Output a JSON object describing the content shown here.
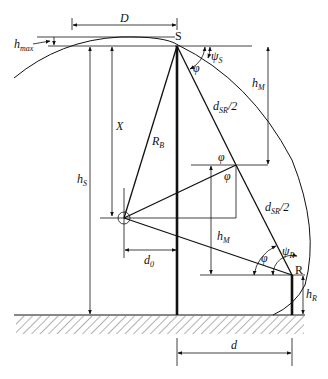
{
  "diagram": {
    "colors": {
      "line": "#111111",
      "ground_hatch": "#555555",
      "background": "#ffffff"
    },
    "points": {
      "S": "S",
      "R": "R"
    },
    "labels": {
      "D": "D",
      "h_max_main": "h",
      "h_max_sub": "max",
      "psi_S_main": "ψ",
      "psi_S_sub": "S",
      "phi_1": "φ",
      "h_M_top_main": "h",
      "h_M_top_sub": "M",
      "d_SR_top_main": "d",
      "d_SR_top_sub": "SR",
      "d_SR_top_suffix": "/2",
      "X": "X",
      "R_B_main": "R",
      "R_B_sub": "B",
      "h_S_main": "h",
      "h_S_sub": "S",
      "phi_2": "φ",
      "phi_3": "φ",
      "d_SR_bot_main": "d",
      "d_SR_bot_sub": "SR",
      "d_SR_bot_suffix": "/2",
      "h_M_bot_main": "h",
      "h_M_bot_sub": "M",
      "phi_4": "φ",
      "psi_R_main": "ψ",
      "psi_R_sub": "R",
      "d0_main": "d",
      "d0_sub": "0",
      "h_R_main": "h",
      "h_R_sub": "R",
      "d": "d"
    }
  }
}
